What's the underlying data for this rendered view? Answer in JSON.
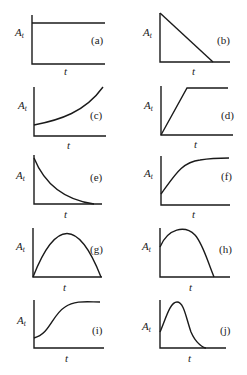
{
  "figure": {
    "y_label": "A",
    "y_label_sub": "t",
    "x_label": "t",
    "panels": [
      {
        "id": "a",
        "tag": "(a)",
        "shape": "constant"
      },
      {
        "id": "b",
        "tag": "(b)",
        "shape": "linear decrease to zero"
      },
      {
        "id": "c",
        "tag": "(c)",
        "shape": "exponential growth"
      },
      {
        "id": "d",
        "tag": "(d)",
        "shape": "linear increase then plateau"
      },
      {
        "id": "e",
        "tag": "(e)",
        "shape": "exponential decay"
      },
      {
        "id": "f",
        "tag": "(f)",
        "shape": "saturating growth"
      },
      {
        "id": "g",
        "tag": "(g)",
        "shape": "symmetric rise and fall from zero to zero"
      },
      {
        "id": "h",
        "tag": "(h)",
        "shape": "rise then fall to zero from nonzero start"
      },
      {
        "id": "i",
        "tag": "(i)",
        "shape": "sigmoidal growth"
      },
      {
        "id": "j",
        "tag": "(j)",
        "shape": "skewed peak decaying to zero"
      }
    ]
  }
}
